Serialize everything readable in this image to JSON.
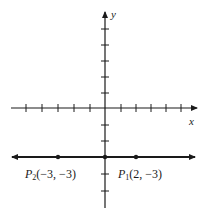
{
  "diagram": {
    "type": "coordinate-plane",
    "axes": {
      "x_label": "x",
      "y_label": "y",
      "x_tick_range": [
        -5,
        5
      ],
      "y_tick_range": [
        -5,
        5
      ]
    },
    "line": {
      "description": "horizontal line y = -3",
      "y": -3,
      "arrows": "both"
    },
    "points": [
      {
        "name": "P",
        "subscript": "2",
        "coords": "(−3, −3)",
        "x": -3,
        "y": -3
      },
      {
        "name": "P",
        "subscript": "1",
        "coords": "(2, −3)",
        "x": 2,
        "y": -3
      }
    ],
    "colors": {
      "ink": "#1a1a1a",
      "background": "#ffffff"
    }
  }
}
